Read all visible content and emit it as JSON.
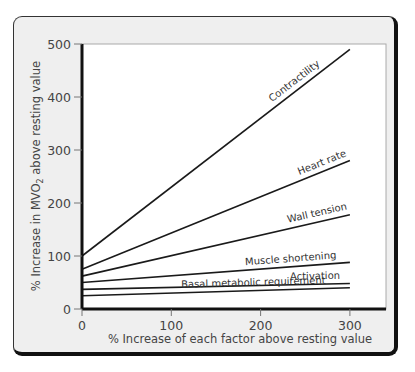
{
  "chart_data": {
    "type": "line",
    "title": "",
    "xlabel": "% Increase of each factor above resting value",
    "ylabel": "% Increase in MVO2 above resting value",
    "ylabel_parts": {
      "pre": "% Increase in M",
      "v": "V",
      "o": "O",
      "sub": "2",
      "post": " above resting value"
    },
    "x": [
      0,
      300
    ],
    "xlim": [
      0,
      330
    ],
    "ylim": [
      0,
      500
    ],
    "xticks": [
      0,
      100,
      200,
      300
    ],
    "yticks": [
      0,
      100,
      200,
      300,
      400,
      500
    ],
    "grid": false,
    "legend": "inline labels",
    "series": [
      {
        "name": "Contractility",
        "values": [
          100,
          490
        ]
      },
      {
        "name": "Heart rate",
        "values": [
          75,
          280
        ]
      },
      {
        "name": "Wall tension",
        "values": [
          62,
          178
        ]
      },
      {
        "name": "Muscle shortening",
        "values": [
          50,
          88
        ]
      },
      {
        "name": "Activation",
        "values": [
          37,
          48
        ]
      },
      {
        "name": "Basal metabolic requirement",
        "values": [
          25,
          40
        ]
      }
    ]
  },
  "colors": {
    "frame_bg": "#efefef",
    "plot_bg": "#ffffff",
    "line": "#1a1a1a",
    "text": "#444444"
  }
}
